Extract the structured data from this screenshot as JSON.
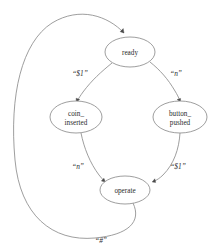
{
  "diagram": {
    "background_color": "#ffffff",
    "node_fill": "#ffffff",
    "node_stroke": "#8d8d8d",
    "edge_stroke": "#8d8d8d",
    "arrow_fill": "#4a4a4a",
    "text_color": "#2b2b2b",
    "nodes": [
      {
        "id": "ready",
        "label_line1": "ready",
        "label_line2": "",
        "cx": 130,
        "cy": 52,
        "rx": 25,
        "ry": 15
      },
      {
        "id": "coin_inserted",
        "label_line1": "coin_",
        "label_line2": "inserted",
        "cx": 76,
        "cy": 117,
        "rx": 26,
        "ry": 16
      },
      {
        "id": "button_pushed",
        "label_line1": "button_",
        "label_line2": "pushed",
        "cx": 180,
        "cy": 117,
        "rx": 27,
        "ry": 16
      },
      {
        "id": "operate",
        "label_line1": "operate",
        "label_line2": "",
        "cx": 125,
        "cy": 190,
        "rx": 25,
        "ry": 14
      }
    ],
    "edges": [
      {
        "id": "ready-to-coin-inserted",
        "from": "ready",
        "to": "coin_inserted",
        "label": "“$1”",
        "label_x": 80,
        "label_y": 76
      },
      {
        "id": "ready-to-button-pushed",
        "from": "ready",
        "to": "button_pushed",
        "label": "“n”",
        "label_x": 176,
        "label_y": 76
      },
      {
        "id": "coin-inserted-to-operate",
        "from": "coin_inserted",
        "to": "operate",
        "label": "“n”",
        "label_x": 78,
        "label_y": 169
      },
      {
        "id": "button-pushed-to-operate",
        "from": "button_pushed",
        "to": "operate",
        "label": "“$1”",
        "label_x": 178,
        "label_y": 169
      },
      {
        "id": "operate-to-ready",
        "from": "operate",
        "to": "ready",
        "label": "“#”",
        "label_x": 101,
        "label_y": 243
      }
    ]
  }
}
